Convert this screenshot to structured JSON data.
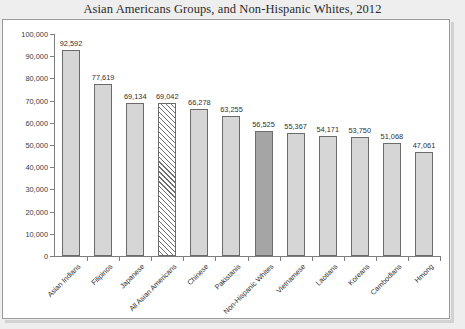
{
  "chart_data": {
    "type": "bar",
    "title": "Asian Americans Groups, and Non-Hispanic Whites, 2012",
    "xlabel": "",
    "ylabel": "",
    "ylim": [
      0,
      100000
    ],
    "grid": false,
    "legend": "none",
    "y_ticks": [
      "0",
      "10,000",
      "20,000",
      "30,000",
      "40,000",
      "50,000",
      "60,000",
      "70,000",
      "80,000",
      "90,000",
      "100,000"
    ],
    "y_tick_values": [
      0,
      10000,
      20000,
      30000,
      40000,
      50000,
      60000,
      70000,
      80000,
      90000,
      100000
    ],
    "categories": [
      "Asian Indians",
      "Filipinos",
      "Japanese",
      "All Asian Americans",
      "Chinese",
      "Pakistanis",
      "Non-Hispanic Whites",
      "Vietnamese",
      "Laotians",
      "Koreans",
      "Cambodians",
      "Hmong"
    ],
    "values": [
      92592,
      77619,
      69134,
      69042,
      66278,
      63255,
      56525,
      55367,
      54171,
      53750,
      51068,
      47061
    ],
    "value_labels": [
      "92,592",
      "77,619",
      "69,134",
      "69,042",
      "66,278",
      "63,255",
      "56,525",
      "55,367",
      "54,171",
      "53,750",
      "51,068",
      "47,061"
    ],
    "bar_styles": [
      "light",
      "light",
      "light",
      "hatched",
      "light",
      "light",
      "dark",
      "light",
      "light",
      "light",
      "light",
      "light"
    ],
    "colors": {
      "bar_light": "#d6d6d6",
      "bar_dark": "#a5a5a5",
      "bar_hatch_line": "#6f6f6f",
      "bar_border": "#6b6b6b",
      "axis": "#7d7d7d",
      "panel_background": "#ffffff",
      "page_background": "#eeeeee",
      "text": "#2f2f2f"
    }
  }
}
